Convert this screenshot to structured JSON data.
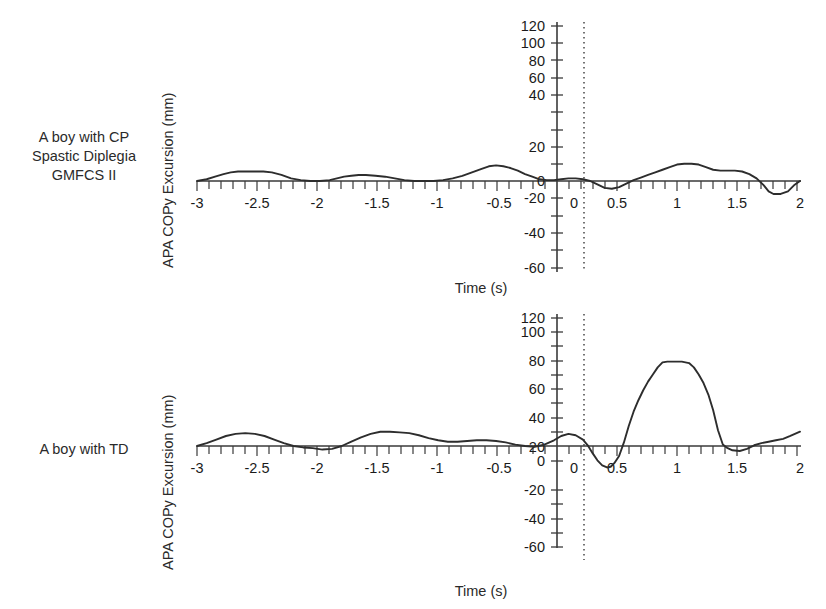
{
  "figure": {
    "panels": [
      {
        "row_label": "A boy with CP\nSpastic Diplegia\nGMFCS II",
        "row_label_line1": "A boy with CP",
        "row_label_line2": "Spastic Diplegia",
        "row_label_line3": "GMFCS II",
        "ylabel": "APA COPy Excursion (mm)",
        "xlabel": "Time (s)"
      },
      {
        "row_label": "A boy with TD",
        "row_label_line1": "A boy with TD",
        "ylabel": "APA COPy Excursion (mm)",
        "xlabel": "Time (s)"
      }
    ],
    "colors": {
      "trace": "#2d2d2d",
      "axis": "#3a3a3a",
      "refline": "#2a2a2a",
      "background": "#ffffff"
    }
  },
  "chart_data": [
    {
      "type": "line",
      "title": "A boy with CP Spastic Diplegia GMFCS II",
      "xlabel": "Time (s)",
      "ylabel": "APA COPy Excursion (mm)",
      "xlim": [
        -3,
        2
      ],
      "ylim": [
        -60,
        120
      ],
      "xticks": [
        -3,
        -2.5,
        -2,
        -1.5,
        -1,
        -0.5,
        0,
        0.5,
        1,
        1.5,
        2
      ],
      "xtick_labels": [
        "-3",
        "-2.5",
        "-2",
        "-1.5",
        "-1",
        "-0.5",
        "0",
        "0.5",
        "1",
        "1.5",
        "2"
      ],
      "yticks": [
        -60,
        -40,
        -20,
        0,
        20,
        40,
        60,
        80,
        100,
        120
      ],
      "ytick_labels": [
        "-60",
        "-40",
        "-20",
        "0",
        "20",
        "40",
        "60",
        "80",
        "100",
        "120"
      ],
      "grid": false,
      "legend": null,
      "annotations": [
        {
          "type": "vertical-dotted-line",
          "x": 0.2,
          "label": "movement onset reference"
        }
      ],
      "x": [
        -3.0,
        -2.92,
        -2.85,
        -2.78,
        -2.72,
        -2.66,
        -2.6,
        -2.52,
        -2.45,
        -2.38,
        -2.3,
        -2.22,
        -2.14,
        -2.06,
        -1.98,
        -1.9,
        -1.84,
        -1.78,
        -1.72,
        -1.66,
        -1.6,
        -1.52,
        -1.44,
        -1.36,
        -1.28,
        -1.2,
        -1.12,
        -1.04,
        -0.96,
        -0.88,
        -0.8,
        -0.72,
        -0.64,
        -0.58,
        -0.52,
        -0.46,
        -0.4,
        -0.34,
        -0.28,
        -0.22,
        -0.16,
        -0.1,
        -0.04,
        0.02,
        0.08,
        0.14,
        0.2,
        0.26,
        0.32,
        0.38,
        0.44,
        0.5,
        0.56,
        0.62,
        0.68,
        0.74,
        0.8,
        0.86,
        0.92,
        0.98,
        1.04,
        1.1,
        1.16,
        1.22,
        1.28,
        1.34,
        1.4,
        1.46,
        1.52,
        1.58,
        1.64,
        1.7,
        1.74,
        1.78,
        1.84,
        1.9,
        1.95,
        2.0
      ],
      "y": [
        0,
        2,
        5,
        8,
        10,
        11,
        11,
        11,
        11,
        10,
        7,
        3,
        1,
        0,
        0,
        1,
        3,
        5,
        6,
        7,
        7,
        6,
        5,
        3,
        1,
        0,
        0,
        0,
        1,
        3,
        6,
        10,
        14,
        17,
        18,
        17,
        15,
        12,
        8,
        5,
        2,
        1,
        1,
        2,
        3,
        3,
        2,
        0,
        -4,
        -8,
        -9,
        -7,
        -3,
        1,
        4,
        7,
        10,
        13,
        16,
        19,
        20,
        20,
        19,
        16,
        13,
        12,
        12,
        12,
        11,
        8,
        3,
        -5,
        -12,
        -15,
        -15,
        -12,
        -5,
        0
      ],
      "series_note": "Single continuous trace; small oscillations about zero with peaks near 18-20 mm and a dip to about -15 mm at t~1.75 s"
    },
    {
      "type": "line",
      "title": "A boy with TD",
      "xlabel": "Time (s)",
      "ylabel": "APA COPy Excursion (mm)",
      "xlim": [
        -3,
        2
      ],
      "ylim": [
        -60,
        120
      ],
      "xticks": [
        -3,
        -2.5,
        -2,
        -1.5,
        -1,
        -0.5,
        0,
        0.5,
        1,
        1.5,
        2
      ],
      "xtick_labels": [
        "-3",
        "-2.5",
        "-2",
        "-1.5",
        "-1",
        "-0.5",
        "0",
        "0.5",
        "1",
        "1.5",
        "2"
      ],
      "yticks": [
        -60,
        -40,
        -20,
        0,
        20,
        40,
        60,
        80,
        100,
        120
      ],
      "ytick_labels": [
        "-60",
        "-40",
        "-20",
        "0",
        "20",
        "40",
        "60",
        "80",
        "100",
        "120"
      ],
      "grid": false,
      "legend": null,
      "annotations": [
        {
          "type": "vertical-dotted-line",
          "x": 0.2,
          "label": "movement onset reference"
        }
      ],
      "x": [
        -3.0,
        -2.92,
        -2.84,
        -2.76,
        -2.68,
        -2.6,
        -2.52,
        -2.44,
        -2.36,
        -2.28,
        -2.2,
        -2.12,
        -2.04,
        -1.96,
        -1.88,
        -1.8,
        -1.72,
        -1.64,
        -1.56,
        -1.48,
        -1.4,
        -1.32,
        -1.24,
        -1.16,
        -1.08,
        -1.0,
        -0.92,
        -0.84,
        -0.76,
        -0.68,
        -0.6,
        -0.52,
        -0.44,
        -0.36,
        -0.28,
        -0.2,
        -0.12,
        -0.04,
        0.02,
        0.08,
        0.14,
        0.2,
        0.24,
        0.28,
        0.32,
        0.36,
        0.4,
        0.43,
        0.46,
        0.5,
        0.54,
        0.58,
        0.62,
        0.66,
        0.7,
        0.74,
        0.78,
        0.82,
        0.86,
        0.9,
        0.96,
        1.02,
        1.08,
        1.12,
        1.16,
        1.2,
        1.24,
        1.28,
        1.32,
        1.36,
        1.4,
        1.44,
        1.5,
        1.56,
        1.62,
        1.68,
        1.74,
        1.8,
        1.86,
        1.92,
        2.0
      ],
      "y": [
        0,
        4,
        9,
        14,
        17,
        18,
        17,
        14,
        9,
        4,
        0,
        -2,
        -3,
        -5,
        -4,
        0,
        6,
        12,
        17,
        20,
        20,
        19,
        18,
        15,
        11,
        8,
        6,
        6,
        7,
        8,
        8,
        7,
        5,
        2,
        0,
        -1,
        2,
        8,
        14,
        17,
        15,
        9,
        1,
        -10,
        -20,
        -27,
        -30,
        -29,
        -24,
        -14,
        5,
        28,
        48,
        64,
        78,
        90,
        100,
        110,
        117,
        118,
        118,
        118,
        116,
        110,
        100,
        88,
        72,
        50,
        22,
        2,
        -3,
        -6,
        -7,
        -4,
        1,
        4,
        6,
        8,
        10,
        14,
        20
      ],
      "series_note": "Single continuous trace; small baseline oscillations before 0 s, sharp negative dip to about -30 mm near 0.4 s, then large excursion peaking near 118 mm between 0.85 and 1.1 s before returning toward baseline"
    }
  ]
}
